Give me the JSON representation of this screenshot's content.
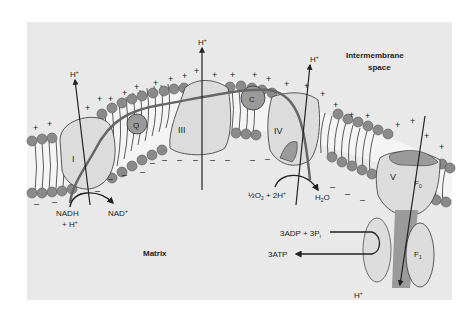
{
  "diagram": {
    "regions": {
      "intermembrane": "Intermembrane",
      "intermembrane2": "space",
      "matrix": "Matrix"
    },
    "complexes": {
      "c1": "I",
      "q": "Q",
      "c3": "III",
      "c": "C",
      "c4": "IV",
      "c5": "V",
      "f0": "F",
      "f0_sub": "0",
      "f1": "F",
      "f1_sub": "1"
    },
    "proton": "H",
    "proton_sup": "+",
    "reactions": {
      "nadh": "NADH",
      "nadh_h": "+ H",
      "nad": "NAD",
      "o2": "½O",
      "o2_sub": "2",
      "o2_rest": " + 2H",
      "h2o_h": "H",
      "h2o_sub": "2",
      "h2o_o": "O",
      "adp": "3ADP + 3P",
      "adp_sub": "i",
      "atp": "3ATP"
    },
    "charges": {
      "positive": "+",
      "negative": "–"
    },
    "colors": {
      "background": "#e9e9e9",
      "protein": "#dcdcdc",
      "protein_dark": "#9a9a9a",
      "lipid_head": "#8a8a8a",
      "line": "#222222"
    }
  }
}
